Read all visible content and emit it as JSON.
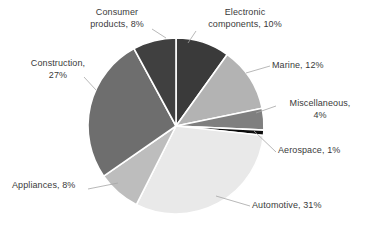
{
  "chart_data": {
    "type": "pie",
    "title": "",
    "subtitle": "",
    "xlabel": "",
    "ylabel": "",
    "legend_position": "none",
    "grid": false,
    "labels_show_percent": true,
    "start_angle_deg": 0,
    "direction": "clockwise",
    "categories": [
      "Electronic components",
      "Marine",
      "Miscellaneous",
      "Aerospace",
      "Automotive",
      "Appliances",
      "Construction",
      "Consumer products"
    ],
    "values": [
      10,
      12,
      4,
      1,
      31,
      8,
      27,
      8
    ],
    "units": "percent",
    "total": 101,
    "colors": [
      "#3a3a3a",
      "#b3b3b3",
      "#7f7f7f",
      "#0d0d0d",
      "#e9e9e9",
      "#bdbdbd",
      "#6e6e6e",
      "#404040"
    ],
    "slices": [
      {
        "name": "Electronic components",
        "value": 10,
        "label": "Electronic components, 10%",
        "color": "#3a3a3a"
      },
      {
        "name": "Marine",
        "value": 12,
        "label": "Marine, 12%",
        "color": "#b3b3b3"
      },
      {
        "name": "Miscellaneous",
        "value": 4,
        "label": "Miscellaneous, 4%",
        "color": "#7f7f7f"
      },
      {
        "name": "Aerospace",
        "value": 1,
        "label": "Aerospace, 1%",
        "color": "#0d0d0d"
      },
      {
        "name": "Automotive",
        "value": 31,
        "label": "Automotive, 31%",
        "color": "#e9e9e9"
      },
      {
        "name": "Appliances",
        "value": 8,
        "label": "Appliances, 8%",
        "color": "#bdbdbd"
      },
      {
        "name": "Construction",
        "value": 27,
        "label": "Construction, 27%",
        "color": "#6e6e6e"
      },
      {
        "name": "Consumer products",
        "value": 8,
        "label": "Consumer products, 8%",
        "color": "#404040"
      }
    ]
  },
  "labels": {
    "consumer_products_line1": "Consumer",
    "consumer_products_line2": "products, 8%",
    "electronic_components_line1": "Electronic",
    "electronic_components_line2": "components, 10%",
    "marine": "Marine, 12%",
    "miscellaneous_line1": "Miscellaneous,",
    "miscellaneous_line2": "4%",
    "aerospace": "Aerospace, 1%",
    "automotive": "Automotive, 31%",
    "appliances": "Appliances, 8%",
    "construction_line1": "Construction,",
    "construction_line2": "27%"
  },
  "style": {
    "background": "#ffffff",
    "text_color": "#3a3a3a",
    "slice_border": "#ffffff",
    "leader_line_color": "#a6a6a6"
  },
  "geometry": {
    "center_x": 176,
    "center_y": 126,
    "radius": 88
  }
}
